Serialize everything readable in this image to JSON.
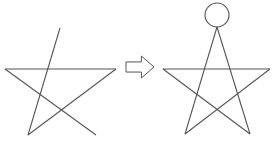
{
  "diagram": {
    "stroke_color": "#555555",
    "left_figure": {
      "label": "",
      "lines": [
        {
          "x1": 60,
          "y1": 28,
          "x2": 28,
          "y2": 135
        },
        {
          "x1": 5,
          "y1": 69,
          "x2": 116,
          "y2": 69
        },
        {
          "x1": 5,
          "y1": 69,
          "x2": 96,
          "y2": 135
        },
        {
          "x1": 116,
          "y1": 69,
          "x2": 28,
          "y2": 135
        }
      ]
    },
    "arrow": {
      "direction": "right",
      "x": 126,
      "y": 56,
      "w": 28,
      "h": 22
    },
    "right_figure": {
      "label": "",
      "circle": {
        "cx": 217,
        "cy": 15,
        "r": 12
      },
      "lines": [
        {
          "x1": 217,
          "y1": 27,
          "x2": 185,
          "y2": 134
        },
        {
          "x1": 217,
          "y1": 27,
          "x2": 250,
          "y2": 134
        },
        {
          "x1": 163,
          "y1": 69,
          "x2": 270,
          "y2": 69
        },
        {
          "x1": 163,
          "y1": 69,
          "x2": 250,
          "y2": 134
        },
        {
          "x1": 270,
          "y1": 69,
          "x2": 185,
          "y2": 134
        }
      ]
    }
  }
}
